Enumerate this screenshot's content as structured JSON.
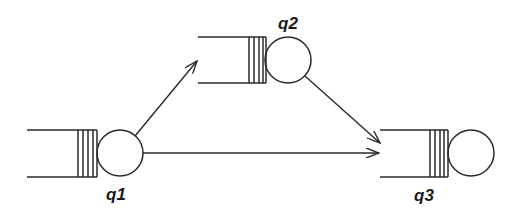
{
  "diagram": {
    "type": "queueing-network",
    "colors": {
      "stroke": "#2a2a2a",
      "background": "#ffffff"
    },
    "nodes": [
      {
        "id": "q1",
        "label": "q1"
      },
      {
        "id": "q2",
        "label": "q2"
      },
      {
        "id": "q3",
        "label": "q3"
      }
    ],
    "edges": [
      {
        "from": "q1",
        "to": "q2"
      },
      {
        "from": "q1",
        "to": "q3"
      },
      {
        "from": "q2",
        "to": "q3"
      }
    ]
  }
}
